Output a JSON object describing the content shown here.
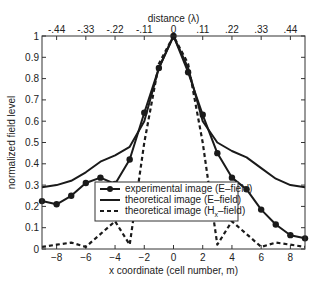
{
  "chart_data": {
    "type": "line",
    "title": "",
    "xlabel": "x coordinate (cell number, m)",
    "ylabel": "normalized field level",
    "x2label": "distance (λ)",
    "xlim": [
      -9,
      9
    ],
    "ylim": [
      0,
      1
    ],
    "grid": false,
    "legend_position": "lower center (inside)",
    "x_ticks": [
      -8,
      -6,
      -4,
      -2,
      0,
      2,
      4,
      6,
      8
    ],
    "y_ticks": [
      0,
      0.1,
      0.2,
      0.3,
      0.4,
      0.5,
      0.6,
      0.7,
      0.8,
      0.9,
      1
    ],
    "y_tick_labels": [
      "0",
      "0.1",
      "0.2",
      "0.3",
      "0.4",
      "0.5",
      "0.6",
      "0.7",
      "0.8",
      "0.9",
      "1"
    ],
    "x2_ticks": [
      -0.44,
      -0.33,
      -0.22,
      -0.11,
      0,
      0.11,
      0.22,
      0.33,
      0.44
    ],
    "x2_tick_labels": [
      "-.44",
      "-.33",
      "-.22",
      "-.11",
      "0",
      ".11",
      ".22",
      ".33",
      ".44"
    ],
    "x": [
      -9,
      -8,
      -7,
      -6,
      -5,
      -4,
      -3,
      -2,
      -1,
      0,
      1,
      2,
      3,
      4,
      5,
      6,
      7,
      8,
      9
    ],
    "series": [
      {
        "name": "experimental image (E–field)",
        "style": "solid-with-circle-markers",
        "values": [
          0.225,
          0.21,
          0.25,
          0.31,
          0.335,
          0.305,
          0.42,
          0.64,
          0.85,
          1.0,
          0.83,
          0.63,
          0.45,
          0.335,
          0.28,
          0.185,
          0.115,
          0.065,
          0.05
        ]
      },
      {
        "name": "theoretical image (E–field)",
        "style": "solid",
        "values": [
          0.29,
          0.3,
          0.32,
          0.36,
          0.41,
          0.44,
          0.48,
          0.6,
          0.85,
          1.0,
          0.85,
          0.6,
          0.5,
          0.46,
          0.43,
          0.38,
          0.33,
          0.3,
          0.29
        ]
      },
      {
        "name": "theoretical image (H",
        "name_subscript": "x",
        "name_suffix": "–field)",
        "style": "dashed",
        "values": [
          0.01,
          0.02,
          0.03,
          0.01,
          0.07,
          0.13,
          0.02,
          0.5,
          0.87,
          1.0,
          0.87,
          0.5,
          0.02,
          0.13,
          0.07,
          0.01,
          0.03,
          0.02,
          0.01
        ]
      }
    ]
  },
  "legend": {
    "items": [
      {
        "label": "experimental image (E–field)"
      },
      {
        "label": "theoretical image (E–field)"
      },
      {
        "label_main": "theoretical image (H",
        "label_sub": "x",
        "label_tail": "–field)"
      }
    ]
  },
  "colors": {
    "line": "#1a1a1a",
    "axis": "#333333",
    "background": "#ffffff"
  }
}
